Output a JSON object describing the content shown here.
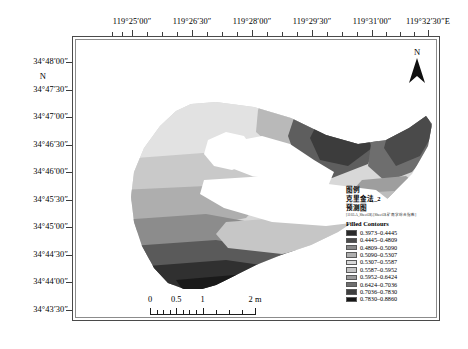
{
  "figure": {
    "type": "thematic-contour-map",
    "background": "#ffffff"
  },
  "axes": {
    "x_unit_suffix": "E",
    "x_labels": [
      {
        "text": "119°25′00″",
        "x": 132
      },
      {
        "text": "119°26′30″",
        "x": 192
      },
      {
        "text": "119°28′00″",
        "x": 252
      },
      {
        "text": "119°29′30″",
        "x": 312
      },
      {
        "text": "119°31′00″",
        "x": 372
      },
      {
        "text": "119°32′30″E",
        "x": 428
      }
    ],
    "y_labels": [
      {
        "text": "34°48′00″",
        "y": 62
      },
      {
        "text": "34°47′30″",
        "y": 90
      },
      {
        "text": "34°47′00″",
        "y": 117
      },
      {
        "text": "34°46′30″",
        "y": 145
      },
      {
        "text": "34°46′00″",
        "y": 172
      },
      {
        "text": "34°45′30″",
        "y": 200
      },
      {
        "text": "34°45′00″",
        "y": 227
      },
      {
        "text": "34°44′30″",
        "y": 255
      },
      {
        "text": "34°44′00″",
        "y": 282
      },
      {
        "text": "34°43′30″",
        "y": 310
      }
    ],
    "hemisphere_marker": {
      "text": "N",
      "y": 76
    }
  },
  "north_arrow": {
    "label": "N",
    "icon": "north-arrow-icon"
  },
  "scale_bar": {
    "labels": [
      "0",
      "0.5",
      "1",
      "2 m"
    ],
    "label_positions": [
      0,
      25,
      50,
      100
    ],
    "unit": "m"
  },
  "legend": {
    "title": "图例",
    "layer_name": "克里金法_2",
    "subtitle": "预测图",
    "note": "[1103.A_Sheet5$].[Sheet5$.矿南学综合指数]",
    "section_label": "Filled Contours",
    "items": [
      {
        "range": "0.3973–0.4445",
        "color": "#2b2b2b",
        "min": 0.3973,
        "max": 0.4445
      },
      {
        "range": "0.4445–0.4809",
        "color": "#4a4a4a",
        "min": 0.4445,
        "max": 0.4809
      },
      {
        "range": "0.4809–0.5090",
        "color": "#8a8a8a",
        "min": 0.4809,
        "max": 0.509
      },
      {
        "range": "0.5090–0.5307",
        "color": "#aeaeae",
        "min": 0.509,
        "max": 0.5307
      },
      {
        "range": "0.5307–0.5587",
        "color": "#d8d8d8",
        "min": 0.5307,
        "max": 0.5587
      },
      {
        "range": "0.5587–0.5952",
        "color": "#c4c4c4",
        "min": 0.5587,
        "max": 0.5952
      },
      {
        "range": "0.5952–0.6424",
        "color": "#9a9a9a",
        "min": 0.5952,
        "max": 0.6424
      },
      {
        "range": "0.6424–0.7036",
        "color": "#6e6e6e",
        "min": 0.6424,
        "max": 0.7036
      },
      {
        "range": "0.7036–0.7830",
        "color": "#3f3f3f",
        "min": 0.7036,
        "max": 0.783
      },
      {
        "range": "0.7830–0.8860",
        "color": "#161616",
        "min": 0.783,
        "max": 0.886
      }
    ]
  },
  "chart_data": {
    "type": "heatmap",
    "title": "克里金法_2 预测图",
    "xlabel": "Longitude",
    "ylabel": "Latitude",
    "xlim": [
      "119°25′00″E",
      "119°32′30″E"
    ],
    "ylim": [
      "34°43′30″N",
      "34°48′00″N"
    ],
    "legend_position": "right",
    "grid": false,
    "value_breaks": [
      0.3973,
      0.4445,
      0.4809,
      0.509,
      0.5307,
      0.5587,
      0.5952,
      0.6424,
      0.7036,
      0.783,
      0.886
    ],
    "class_colors": [
      "#2b2b2b",
      "#4a4a4a",
      "#8a8a8a",
      "#aeaeae",
      "#d8d8d8",
      "#c4c4c4",
      "#9a9a9a",
      "#6e6e6e",
      "#3f3f3f",
      "#161616"
    ],
    "unit": "m",
    "scalebar_values": [
      0,
      0.5,
      1,
      2
    ]
  }
}
